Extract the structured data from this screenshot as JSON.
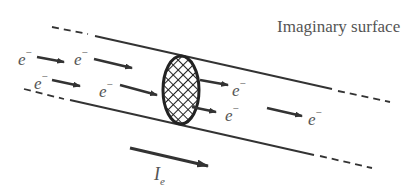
{
  "diagram": {
    "title": "Imaginary surface",
    "electron_symbol": "e",
    "electron_charge": "−",
    "current_symbol": "I",
    "current_subscript": "e",
    "colors": {
      "line": "#333333",
      "text": "#555555",
      "hatch": "#222222"
    },
    "electrons": [
      {
        "id": "e1",
        "x": 18,
        "y": 70
      },
      {
        "id": "e2",
        "x": 74,
        "y": 70
      },
      {
        "id": "e3",
        "x": 34,
        "y": 96
      },
      {
        "id": "e4",
        "x": 100,
        "y": 102
      },
      {
        "id": "e5",
        "x": 232,
        "y": 126
      },
      {
        "id": "e6",
        "x": 225,
        "y": 150
      },
      {
        "id": "e7",
        "x": 306,
        "y": 150
      }
    ]
  }
}
